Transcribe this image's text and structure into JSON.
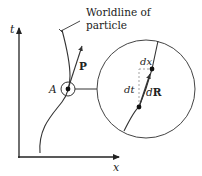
{
  "diagram": {
    "axes": {
      "vertical_label": "t",
      "horizontal_label": "x"
    },
    "annotation": {
      "line1": "Worldline of",
      "line2": "particle"
    },
    "point_label": "A",
    "momentum_label": "P",
    "zoom_view": {
      "dx_label": "dx",
      "dt_label": "dt",
      "dR_prefix": "d",
      "dR_vector": "R"
    },
    "colors": {
      "stroke": "#333333",
      "dashed": "#999999",
      "background": "#ffffff"
    }
  }
}
